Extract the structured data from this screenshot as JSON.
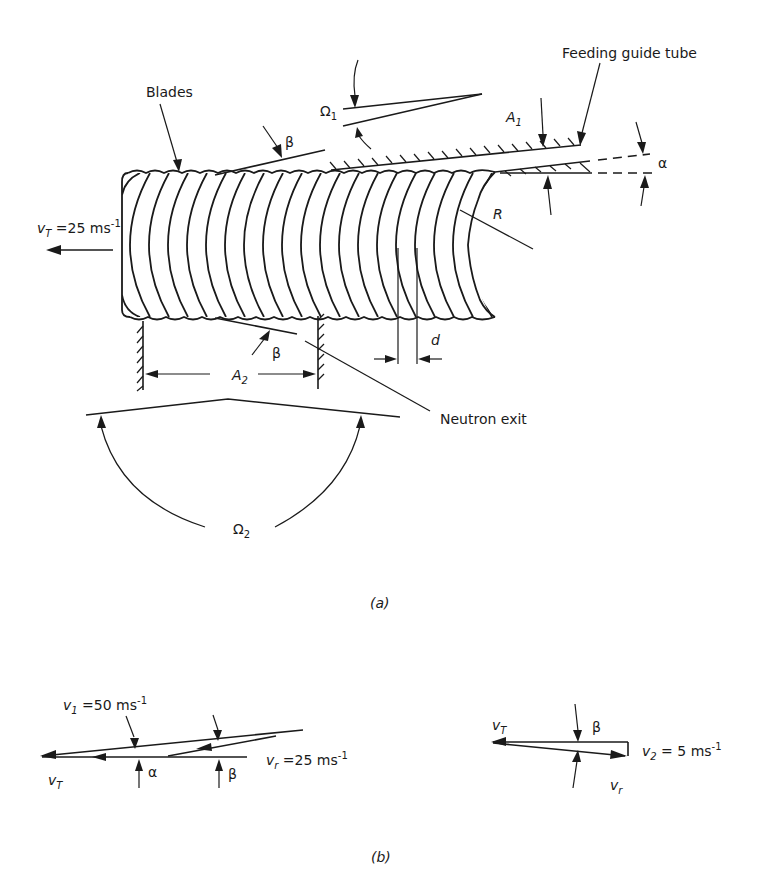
{
  "figure": {
    "part_a": {
      "caption": "(a)",
      "labels": {
        "blades": "Blades",
        "feeding_guide_tube": "Feeding guide tube",
        "neutron_exit": "Neutron exit",
        "omega1": "Ω",
        "omega1_sub": "1",
        "omega2": "Ω",
        "omega2_sub": "2",
        "A1": "A",
        "A1_sub": "1",
        "A2": "A",
        "A2_sub": "2",
        "alpha": "α",
        "beta_top": "β",
        "beta_bottom": "β",
        "R": "R",
        "d": "d",
        "vT_velocity_main": "v",
        "vT_velocity_sub": "T",
        "vT_velocity_rest": " =25 ms",
        "vT_velocity_exp": "-1"
      }
    },
    "part_b": {
      "caption": "(b)",
      "left": {
        "v1_main": "v",
        "v1_sub": "1",
        "v1_rest": " =50  ms",
        "v1_exp": "-1",
        "vr_main": "v",
        "vr_sub": "r",
        "vr_rest": " =25  ms",
        "vr_exp": "-1",
        "vT_main": "v",
        "vT_sub": "T",
        "alpha": "α",
        "beta": "β"
      },
      "right": {
        "vT_main": "v",
        "vT_sub": "T",
        "beta": "β",
        "v2_main": "v",
        "v2_sub": "2",
        "v2_rest": " = 5  ms",
        "v2_exp": "-1",
        "vr_main": "v",
        "vr_sub": "r"
      }
    }
  }
}
